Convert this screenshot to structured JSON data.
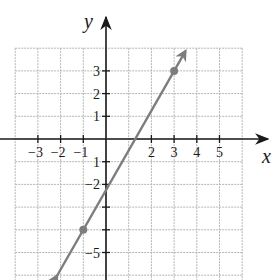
{
  "graph": {
    "x_axis_label": "x",
    "y_axis_label": "y",
    "x_tick_labels": [
      {
        "value": -3,
        "text": "−3"
      },
      {
        "value": -2,
        "text": "−2"
      },
      {
        "value": -1,
        "text": "−1"
      },
      {
        "value": 2,
        "text": "2"
      },
      {
        "value": 3,
        "text": "3"
      },
      {
        "value": 4,
        "text": "4"
      },
      {
        "value": 5,
        "text": "5"
      }
    ],
    "y_tick_labels": [
      {
        "value": 3,
        "text": "3"
      },
      {
        "value": 2,
        "text": "2"
      },
      {
        "value": 1,
        "text": "1"
      },
      {
        "value": -1,
        "text": "1"
      },
      {
        "value": -2,
        "text": "−2"
      },
      {
        "value": -5,
        "text": "−5"
      }
    ],
    "points": [
      {
        "x": 3,
        "y": 3
      },
      {
        "x": -1,
        "y": -4
      }
    ],
    "line": {
      "slope": 1.75,
      "intercept": -2.25,
      "color": "#7d7d7d"
    },
    "grid": {
      "x_min": -4,
      "x_max": 6,
      "y_min": -6,
      "y_max": 4
    }
  }
}
